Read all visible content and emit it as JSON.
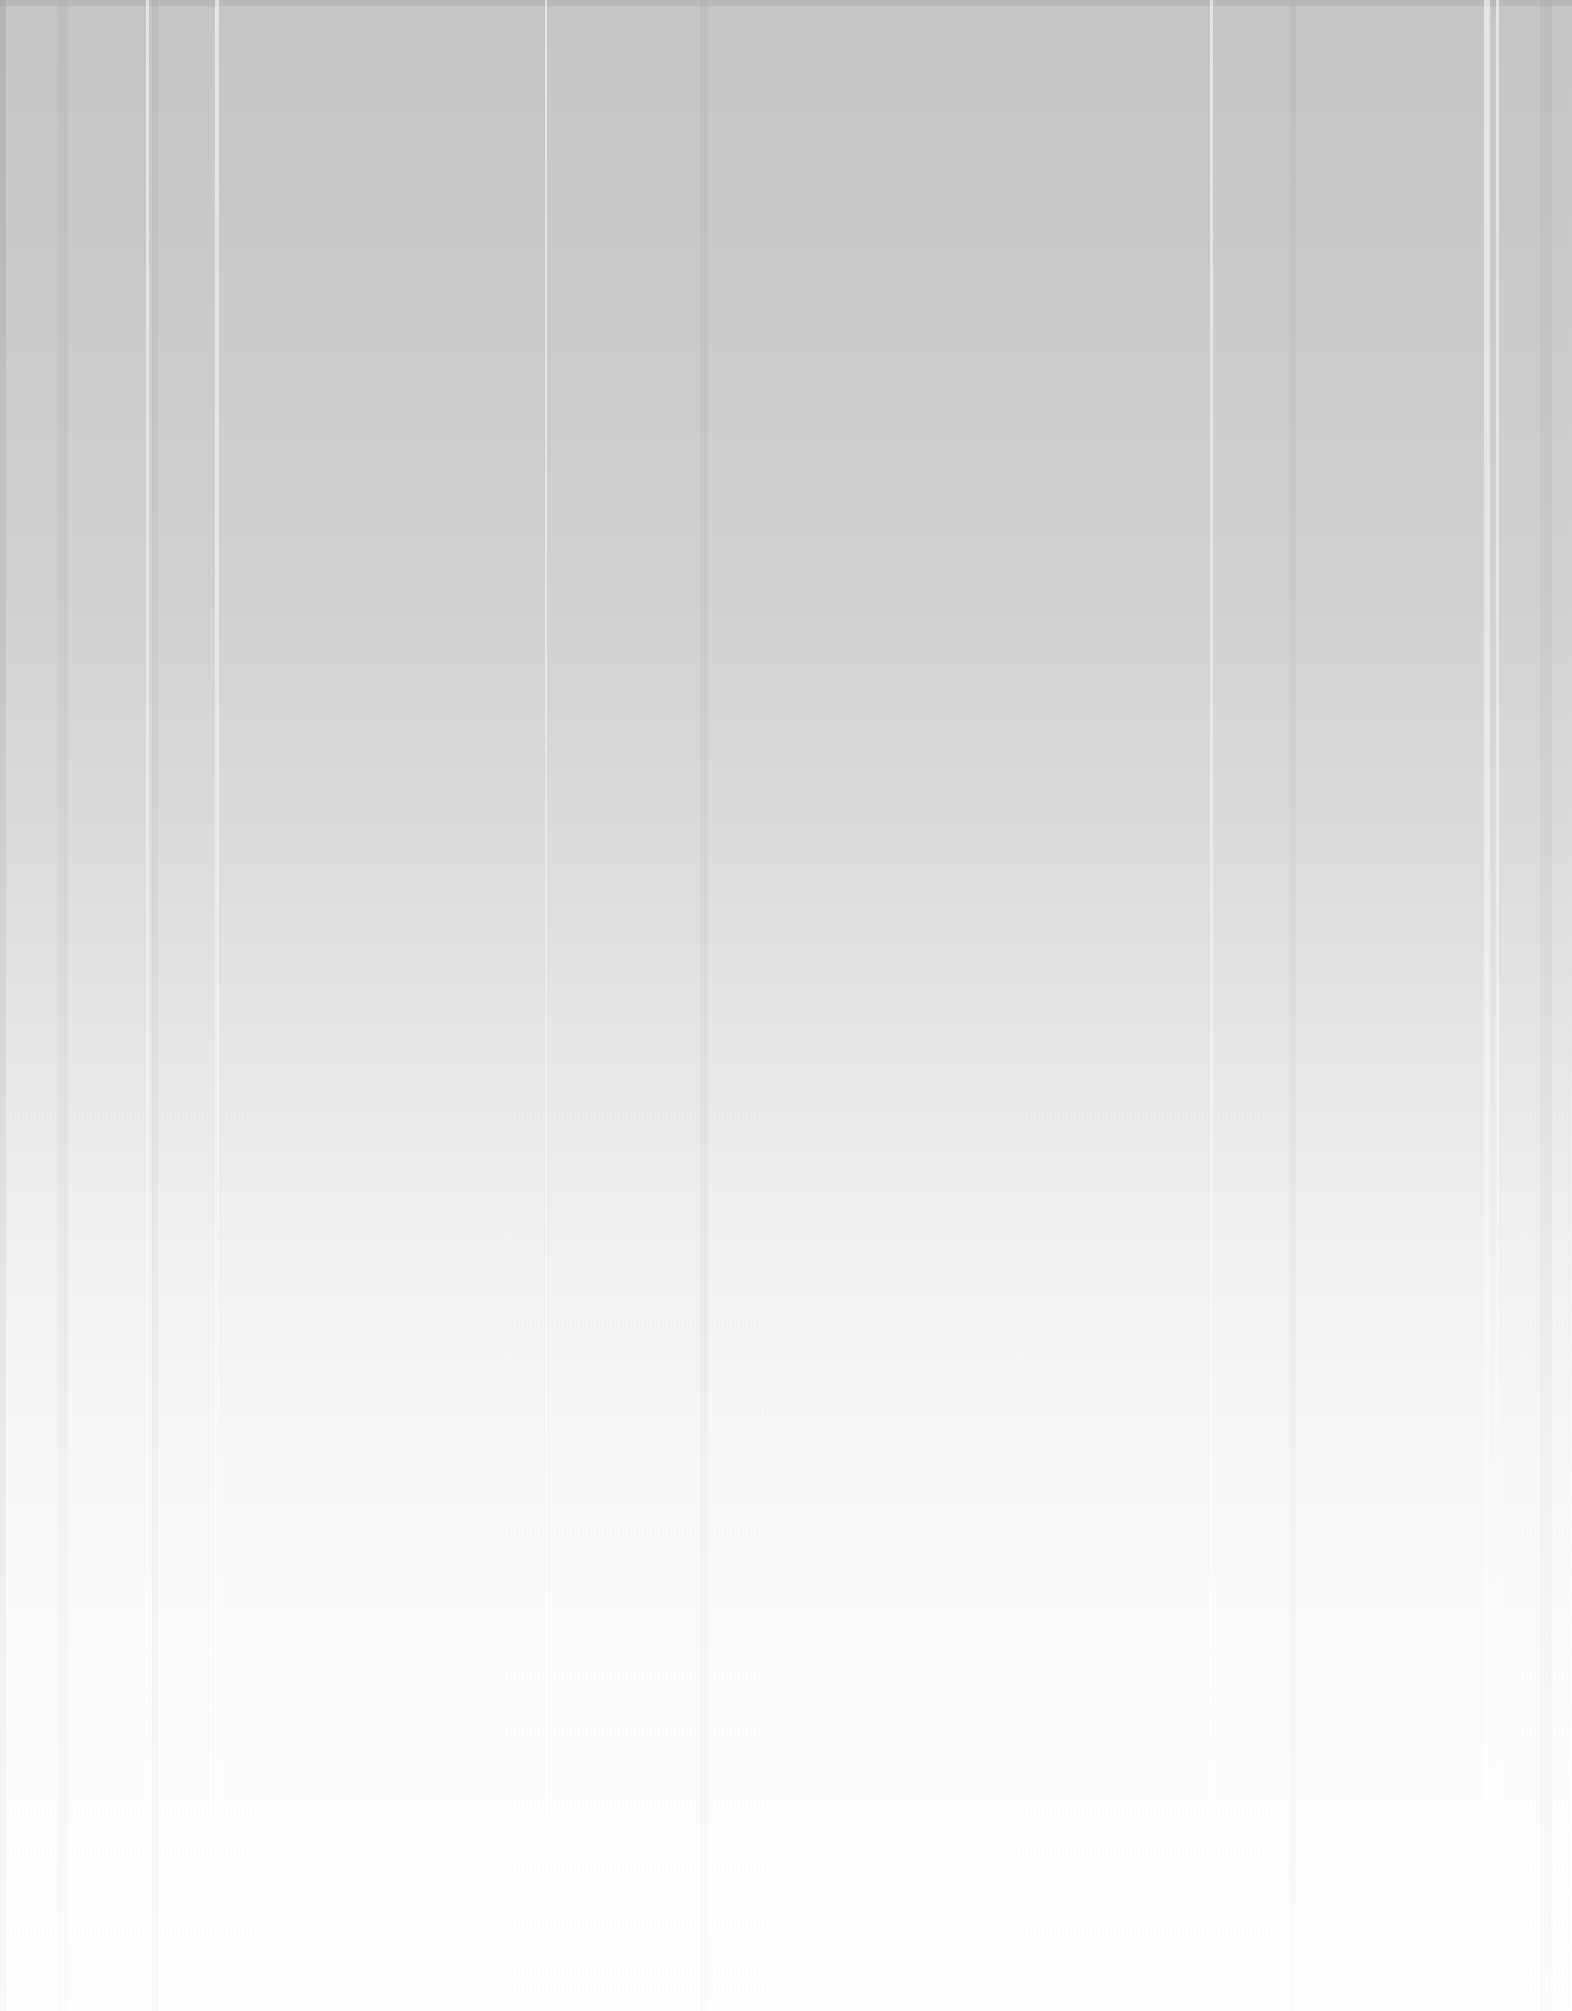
{
  "page": {
    "type": "blank-scanned-page",
    "text": "",
    "background": {
      "top_color": "#c6c6c6",
      "bottom_color": "#ffffff"
    }
  }
}
